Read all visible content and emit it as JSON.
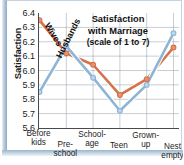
{
  "chart_data": {
    "type": "line",
    "subtitle": "(scale of 1 to 7)",
    "title_lines": [
      "Satisfaction",
      "with Marriage",
      "(scale of 1 to 7)"
    ],
    "xlabel": "",
    "ylabel": "Satisfaction",
    "ylim": [
      5.6,
      6.4
    ],
    "ytick_labels": [
      "6.4",
      "6.3",
      "6.2",
      "6.1",
      "6.0",
      "5.9",
      "5.8",
      "5.7",
      "5.6"
    ],
    "ytick_values": [
      6.4,
      6.3,
      6.2,
      6.1,
      6.0,
      5.9,
      5.8,
      5.7,
      5.6
    ],
    "grid": true,
    "legend": "inline-labels",
    "categories": [
      "Before kids",
      "Pre-school",
      "School-age",
      "Teen",
      "Grown-up",
      "Nest empty"
    ],
    "category_lines": [
      [
        "Before",
        "kids"
      ],
      [
        "Pre-",
        "school"
      ],
      [
        "School-",
        "age"
      ],
      [
        "Teen"
      ],
      [
        "Grown-",
        "up"
      ],
      [
        "Nest",
        "empty"
      ]
    ],
    "series": [
      {
        "name": "Wives",
        "color": "#d4724a",
        "marker_fill": "#e3956f",
        "values": [
          6.35,
          6.12,
          6.04,
          5.83,
          5.94,
          6.16
        ]
      },
      {
        "name": "Husbands",
        "color": "#8fb4d4",
        "marker_fill": "#bcd6ea",
        "values": [
          5.85,
          6.17,
          5.95,
          5.72,
          5.9,
          6.26
        ]
      }
    ]
  },
  "colors": {
    "wives": "#d4724a",
    "husbands": "#8fb4d4",
    "axis": "#4a4a4a",
    "grid": "#9aa4ad",
    "frame": "#b9cbdd",
    "text": "#1b1b1b"
  }
}
